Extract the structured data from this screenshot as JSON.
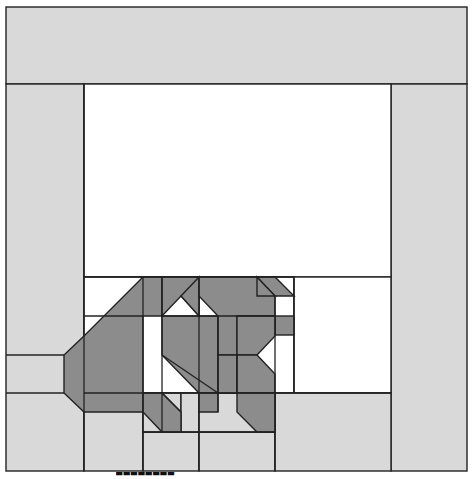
{
  "figure": {
    "type": "tiling-diagram",
    "colors": {
      "light_cell": "#d9d9d9",
      "white_cell": "#ffffff",
      "dark_shape": "#8c8c8c",
      "stroke": "#222222"
    },
    "cut_off_caption": "▀▀▀▀▀▀▀▀"
  }
}
